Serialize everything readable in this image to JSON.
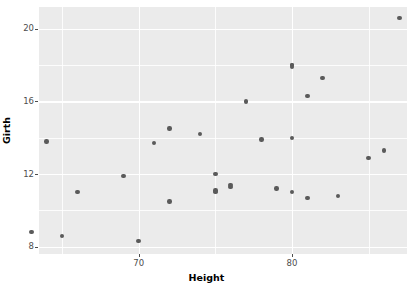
{
  "chart_data": {
    "type": "scatter",
    "title": "",
    "xlabel": "Height",
    "ylabel": "Girth",
    "xlim": [
      63.5,
      87.5
    ],
    "ylim": [
      7.6,
      21.2
    ],
    "grid": true,
    "legend": "none",
    "point_color": "#5a5a5a",
    "panel_color": "#ebebeb",
    "gridline_color": "#ffffff",
    "x_ticks": [
      {
        "value": 70,
        "label": "70"
      },
      {
        "value": 80,
        "label": "80"
      }
    ],
    "x_minor_ticks": [
      65,
      75,
      85
    ],
    "y_ticks": [
      {
        "value": 20,
        "label": "20"
      },
      {
        "value": 16,
        "label": "16"
      },
      {
        "value": 12,
        "label": "12"
      },
      {
        "value": 8,
        "label": "8"
      }
    ],
    "y_minor_ticks": [
      10,
      14,
      18
    ],
    "points": [
      {
        "x": 70,
        "y": 8.3
      },
      {
        "x": 65,
        "y": 8.6
      },
      {
        "x": 63,
        "y": 8.8
      },
      {
        "x": 72,
        "y": 10.5
      },
      {
        "x": 81,
        "y": 10.7
      },
      {
        "x": 83,
        "y": 10.8
      },
      {
        "x": 66,
        "y": 11.0
      },
      {
        "x": 75,
        "y": 11.0
      },
      {
        "x": 80,
        "y": 11.0
      },
      {
        "x": 75,
        "y": 11.1
      },
      {
        "x": 79,
        "y": 11.2
      },
      {
        "x": 76,
        "y": 11.3
      },
      {
        "x": 76,
        "y": 11.4
      },
      {
        "x": 69,
        "y": 11.9
      },
      {
        "x": 75,
        "y": 12.0
      },
      {
        "x": 85,
        "y": 12.9
      },
      {
        "x": 86,
        "y": 13.3
      },
      {
        "x": 71,
        "y": 13.7
      },
      {
        "x": 64,
        "y": 13.8
      },
      {
        "x": 78,
        "y": 13.9
      },
      {
        "x": 80,
        "y": 14.0
      },
      {
        "x": 74,
        "y": 14.2
      },
      {
        "x": 72,
        "y": 14.5
      },
      {
        "x": 77,
        "y": 16.0
      },
      {
        "x": 81,
        "y": 16.3
      },
      {
        "x": 82,
        "y": 17.3
      },
      {
        "x": 80,
        "y": 17.9
      },
      {
        "x": 80,
        "y": 18.0
      },
      {
        "x": 80,
        "y": 18.0
      },
      {
        "x": 87,
        "y": 20.6
      }
    ]
  }
}
